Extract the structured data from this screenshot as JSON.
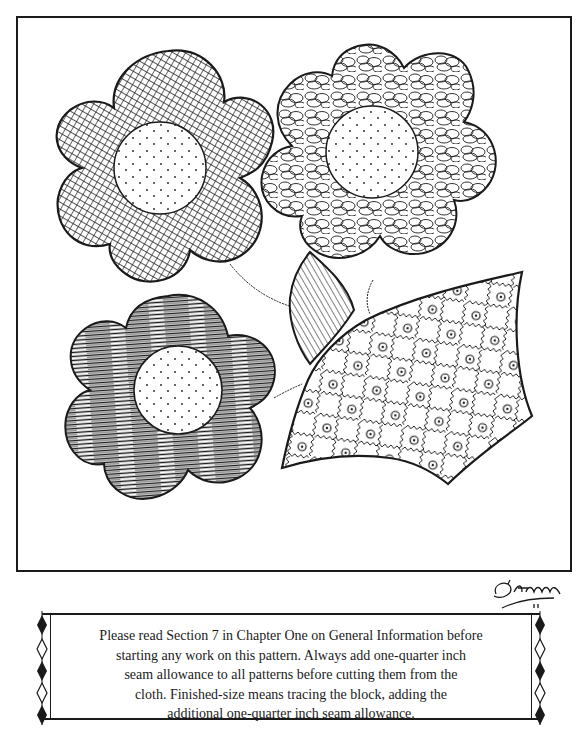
{
  "illustration": {
    "title": "Flower pattern block",
    "elements": [
      {
        "name": "crosshatch-flower",
        "fill": "crosshatch"
      },
      {
        "name": "scribble-flower",
        "fill": "scribble loops"
      },
      {
        "name": "striped-flower",
        "fill": "horizontal streaks"
      },
      {
        "name": "hatched-leaf",
        "fill": "diagonal lines"
      },
      {
        "name": "checkered-leaf",
        "fill": "zigzag checkerboard with small flowers"
      }
    ],
    "colors": {
      "ink": "#1a1a1a",
      "paper": "#ffffff"
    }
  },
  "signature": {
    "text": "D'Ann"
  },
  "notice": {
    "lines": [
      "Please read Section 7 in Chapter One on General Information before",
      "starting any work on this pattern. Always add one-quarter inch",
      "seam allowance to all patterns before cutting them from the",
      "cloth. Finished-size means tracing the block, adding the",
      "additional one-quarter inch seam allowance."
    ]
  }
}
